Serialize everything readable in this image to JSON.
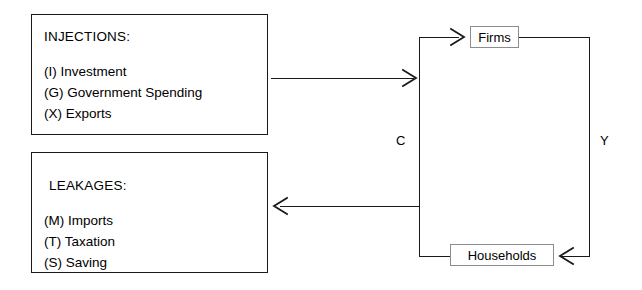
{
  "diagram": {
    "injections": {
      "heading": "INJECTIONS:",
      "items": [
        "(I) Investment",
        "(G) Government Spending",
        "(X) Exports"
      ]
    },
    "leakages": {
      "heading": "LEAKAGES:",
      "items": [
        "(M) Imports",
        "(T) Taxation",
        "(S) Saving"
      ]
    },
    "nodes": {
      "firms": "Firms",
      "households": "Households"
    },
    "flow_labels": {
      "consumption": "C",
      "income": "Y"
    },
    "colors": {
      "line": "#1a1a1a",
      "node_border": "#8c8c8c",
      "background": "#ffffff",
      "text": "#000000"
    }
  }
}
